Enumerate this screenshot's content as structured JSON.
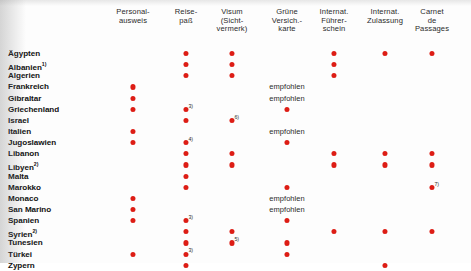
{
  "document": {
    "title": "Reisedokumente und Versicherungen nach Land",
    "dot_color": "#dd1d15",
    "text_color": "#111111"
  },
  "columns": [
    {
      "key": "personalausweis",
      "label": "Personal-\nausweis",
      "x": 133
    },
    {
      "key": "reisepass",
      "label": "Reise-\npaß",
      "x": 186
    },
    {
      "key": "visum",
      "label": "Visum\n(Sicht-\nvermerk)",
      "x": 232
    },
    {
      "key": "gruene_karte",
      "label": "Grüne\nVersich.-\nkarte",
      "x": 287
    },
    {
      "key": "int_fuehrerschein",
      "label": "Internat.\nFührer-\nschein",
      "x": 334
    },
    {
      "key": "int_zulassung",
      "label": "Internat.\nZulassung",
      "x": 385
    },
    {
      "key": "carnet",
      "label": "Carnet\nde\nPassages",
      "x": 432
    }
  ],
  "labels": {
    "empfohlen": "empfohlen"
  },
  "rows": [
    {
      "country": "Ägypten",
      "footnote": "",
      "cells": {
        "personalausweis": "",
        "reisepass": "dot",
        "visum": "dot",
        "gruene_karte": "",
        "int_fuehrerschein": "dot",
        "int_zulassung": "dot",
        "carnet": "dot"
      }
    },
    {
      "country": "Albanien",
      "footnote": "1)",
      "cells": {
        "personalausweis": "",
        "reisepass": "dot",
        "visum": "dot",
        "gruene_karte": "",
        "int_fuehrerschein": "dot",
        "int_zulassung": "",
        "carnet": ""
      }
    },
    {
      "country": "Algerien",
      "footnote": "",
      "cells": {
        "personalausweis": "",
        "reisepass": "dot",
        "visum": "dot",
        "gruene_karte": "",
        "int_fuehrerschein": "dot",
        "int_zulassung": "",
        "carnet": ""
      }
    },
    {
      "country": "Frankreich",
      "footnote": "",
      "cells": {
        "personalausweis": "dot",
        "reisepass": "",
        "visum": "",
        "gruene_karte": "empfohlen",
        "int_fuehrerschein": "",
        "int_zulassung": "",
        "carnet": ""
      }
    },
    {
      "country": "Gibraltar",
      "footnote": "",
      "cells": {
        "personalausweis": "dot",
        "reisepass": "",
        "visum": "",
        "gruene_karte": "empfohlen",
        "int_fuehrerschein": "",
        "int_zulassung": "",
        "carnet": ""
      }
    },
    {
      "country": "Griechenland",
      "footnote": "",
      "cells": {
        "personalausweis": "dot",
        "reisepass": "dot|3)",
        "visum": "",
        "gruene_karte": "dot",
        "int_fuehrerschein": "",
        "int_zulassung": "",
        "carnet": ""
      }
    },
    {
      "country": "Israel",
      "footnote": "",
      "cells": {
        "personalausweis": "",
        "reisepass": "dot",
        "visum": "dot|6)",
        "gruene_karte": "",
        "int_fuehrerschein": "",
        "int_zulassung": "",
        "carnet": ""
      }
    },
    {
      "country": "Italien",
      "footnote": "",
      "cells": {
        "personalausweis": "dot",
        "reisepass": "",
        "visum": "",
        "gruene_karte": "empfohlen",
        "int_fuehrerschein": "",
        "int_zulassung": "",
        "carnet": ""
      }
    },
    {
      "country": "Jugoslawien",
      "footnote": "",
      "cells": {
        "personalausweis": "dot",
        "reisepass": "dot|4)",
        "visum": "",
        "gruene_karte": "dot",
        "int_fuehrerschein": "",
        "int_zulassung": "",
        "carnet": ""
      }
    },
    {
      "country": "Libanon",
      "footnote": "",
      "cells": {
        "personalausweis": "",
        "reisepass": "dot",
        "visum": "dot",
        "gruene_karte": "",
        "int_fuehrerschein": "dot",
        "int_zulassung": "dot",
        "carnet": "dot"
      }
    },
    {
      "country": "Libyen",
      "footnote": "2)",
      "cells": {
        "personalausweis": "",
        "reisepass": "dot",
        "visum": "dot",
        "gruene_karte": "",
        "int_fuehrerschein": "dot",
        "int_zulassung": "dot",
        "carnet": "dot"
      }
    },
    {
      "country": "Malta",
      "footnote": "",
      "cells": {
        "personalausweis": "",
        "reisepass": "dot",
        "visum": "",
        "gruene_karte": "",
        "int_fuehrerschein": "",
        "int_zulassung": "",
        "carnet": ""
      }
    },
    {
      "country": "Marokko",
      "footnote": "",
      "cells": {
        "personalausweis": "",
        "reisepass": "dot",
        "visum": "",
        "gruene_karte": "dot",
        "int_fuehrerschein": "",
        "int_zulassung": "",
        "carnet": "dot|7)"
      }
    },
    {
      "country": "Monaco",
      "footnote": "",
      "cells": {
        "personalausweis": "dot",
        "reisepass": "",
        "visum": "",
        "gruene_karte": "empfohlen",
        "int_fuehrerschein": "",
        "int_zulassung": "",
        "carnet": ""
      }
    },
    {
      "country": "San Marino",
      "footnote": "",
      "cells": {
        "personalausweis": "dot",
        "reisepass": "",
        "visum": "",
        "gruene_karte": "empfohlen",
        "int_fuehrerschein": "",
        "int_zulassung": "",
        "carnet": ""
      }
    },
    {
      "country": "Spanien",
      "footnote": "",
      "cells": {
        "personalausweis": "dot",
        "reisepass": "dot|3)",
        "visum": "",
        "gruene_karte": "dot",
        "int_fuehrerschein": "",
        "int_zulassung": "",
        "carnet": ""
      }
    },
    {
      "country": "Syrien",
      "footnote": "2)",
      "cells": {
        "personalausweis": "",
        "reisepass": "dot",
        "visum": "dot",
        "gruene_karte": "",
        "int_fuehrerschein": "dot",
        "int_zulassung": "dot",
        "carnet": "dot"
      }
    },
    {
      "country": "Tunesien",
      "footnote": "",
      "cells": {
        "personalausweis": "",
        "reisepass": "dot",
        "visum": "dot|5)",
        "gruene_karte": "dot",
        "int_fuehrerschein": "",
        "int_zulassung": "",
        "carnet": ""
      }
    },
    {
      "country": "Türkei",
      "footnote": "",
      "cells": {
        "personalausweis": "dot",
        "reisepass": "dot|3)",
        "visum": "",
        "gruene_karte": "dot",
        "int_fuehrerschein": "",
        "int_zulassung": "",
        "carnet": ""
      }
    },
    {
      "country": "Zypern",
      "footnote": "",
      "cells": {
        "personalausweis": "",
        "reisepass": "dot",
        "visum": "",
        "gruene_karte": "",
        "int_fuehrerschein": "",
        "int_zulassung": "dot",
        "carnet": ""
      }
    }
  ]
}
